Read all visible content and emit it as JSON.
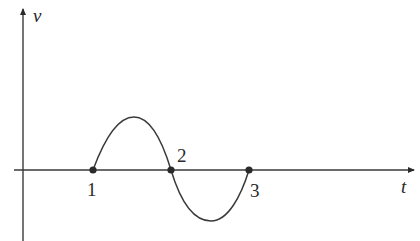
{
  "diagram": {
    "axes": {
      "y_label": "v",
      "x_label": "t"
    },
    "points": [
      {
        "label": "1",
        "x": 93,
        "y": 170
      },
      {
        "label": "2",
        "x": 171,
        "y": 170
      },
      {
        "label": "3",
        "x": 249,
        "y": 170
      }
    ],
    "curve": {
      "shape": "one full sine period",
      "start": "point 1",
      "positive_half": "between point 1 and point 2",
      "negative_half": "between point 2 and point 3"
    },
    "colors": {
      "line": "#3a3a3a",
      "background": "#ffffff"
    }
  }
}
